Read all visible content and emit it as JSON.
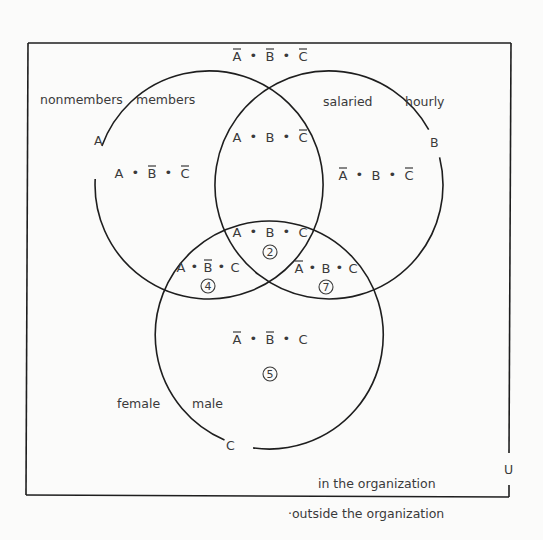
{
  "diagram": {
    "type": "venn",
    "universe_label": "U",
    "universe_inside_label": "in the organization",
    "universe_outside_label": "·outside the organization",
    "sets": [
      {
        "id": "A",
        "label": "A",
        "inside_label": "members",
        "outside_label": "nonmembers"
      },
      {
        "id": "B",
        "label": "B",
        "inside_label": "salaried",
        "outside_label": "hourly"
      },
      {
        "id": "C",
        "label": "C",
        "inside_label": "male",
        "outside_label": "female"
      }
    ],
    "regions": [
      {
        "id": "none",
        "terms": [
          {
            "v": "A",
            "bar": true
          },
          {
            "v": "B",
            "bar": true
          },
          {
            "v": "C",
            "bar": true
          }
        ],
        "number": null
      },
      {
        "id": "A_only",
        "terms": [
          {
            "v": "A",
            "bar": false
          },
          {
            "v": "B",
            "bar": true
          },
          {
            "v": "C",
            "bar": true
          }
        ],
        "number": null
      },
      {
        "id": "AB",
        "terms": [
          {
            "v": "A",
            "bar": false
          },
          {
            "v": "B",
            "bar": false
          },
          {
            "v": "C",
            "bar": true
          }
        ],
        "number": null
      },
      {
        "id": "B_only",
        "terms": [
          {
            "v": "A",
            "bar": true
          },
          {
            "v": "B",
            "bar": false
          },
          {
            "v": "C",
            "bar": true
          }
        ],
        "number": null
      },
      {
        "id": "ABC",
        "terms": [
          {
            "v": "A",
            "bar": false
          },
          {
            "v": "B",
            "bar": false
          },
          {
            "v": "C",
            "bar": false
          }
        ],
        "number": "2"
      },
      {
        "id": "AC",
        "terms": [
          {
            "v": "A",
            "bar": false
          },
          {
            "v": "B",
            "bar": true
          },
          {
            "v": "C",
            "bar": false
          }
        ],
        "number": "4"
      },
      {
        "id": "BC",
        "terms": [
          {
            "v": "A",
            "bar": true
          },
          {
            "v": "B",
            "bar": false
          },
          {
            "v": "C",
            "bar": false
          }
        ],
        "number": "7"
      },
      {
        "id": "C_only",
        "terms": [
          {
            "v": "A",
            "bar": true
          },
          {
            "v": "B",
            "bar": true
          },
          {
            "v": "C",
            "bar": false
          }
        ],
        "number": "5"
      }
    ],
    "separator": "•"
  }
}
